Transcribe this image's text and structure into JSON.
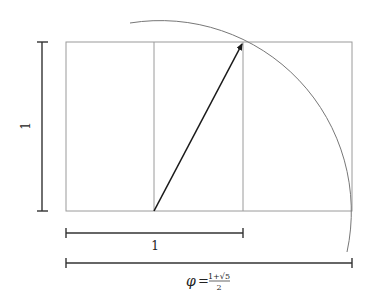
{
  "diagram": {
    "labels": {
      "vertical_side": "1",
      "square_side": "1",
      "phi_symbol": "φ",
      "phi_equals": "=",
      "phi_numerator": "1+√5",
      "phi_denominator": "2"
    },
    "colors": {
      "rect_stroke": "#9a9a9a",
      "arrow": "#1a1a1a",
      "dimension": "#333333",
      "arc": "#777777"
    }
  }
}
